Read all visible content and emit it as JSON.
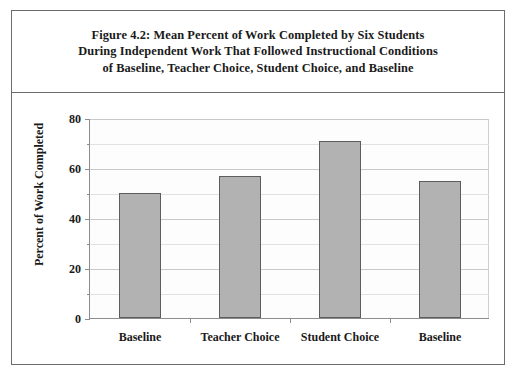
{
  "figure": {
    "title_lines": [
      "Figure 4.2: Mean Percent of Work Completed by Six Students",
      "During Independent Work That Followed Instructional Conditions",
      "of Baseline, Teacher Choice, Student Choice, and Baseline"
    ]
  },
  "colors": {
    "bar_fill": "#b2b2b2",
    "bar_border": "#5d5d5d",
    "axis": "#8d8d8d",
    "grid": "#c9c9c9",
    "frame": "#6b6b6b",
    "text": "#1a1a1a",
    "plot_background": "#fdfdfd"
  },
  "chart_data": {
    "type": "bar",
    "title": "Figure 4.2: Mean Percent of Work Completed by Six Students During Independent Work That Followed Instructional Conditions of Baseline, Teacher Choice, Student Choice, and Baseline",
    "xlabel": "",
    "ylabel": "Percent of Work Completed",
    "categories": [
      "Baseline",
      "Teacher Choice",
      "Student Choice",
      "Baseline"
    ],
    "values": [
      50,
      57,
      71,
      55
    ],
    "ylim": [
      0,
      80
    ],
    "ytick_labels": [
      "0",
      "20",
      "40",
      "60",
      "80"
    ],
    "ytick_values": [
      0,
      20,
      40,
      60,
      80
    ],
    "minor_tick_values": [
      10,
      30,
      50,
      70
    ],
    "grid": "horizontal",
    "legend": "none"
  }
}
